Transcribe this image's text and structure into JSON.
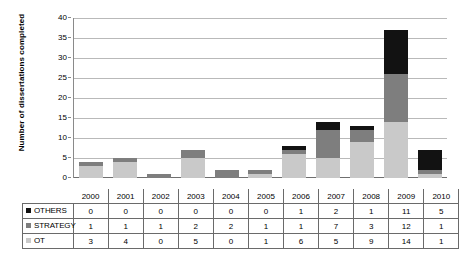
{
  "chart_data": {
    "type": "bar",
    "stacked": true,
    "title": "",
    "xlabel": "",
    "ylabel": "Number of dissertations completed",
    "ylim": [
      0,
      40
    ],
    "yticks": [
      0,
      5,
      10,
      15,
      20,
      25,
      30,
      35,
      40
    ],
    "grid": true,
    "legend_position": "table-row-labels",
    "categories": [
      "2000",
      "2001",
      "2002",
      "2003",
      "2004",
      "2005",
      "2006",
      "2007",
      "2008",
      "2009",
      "2010"
    ],
    "series": [
      {
        "name": "OT",
        "color": "#c9c9c9",
        "swatch": "ot-swatch",
        "values": [
          3,
          4,
          0,
          5,
          0,
          1,
          6,
          5,
          9,
          14,
          1
        ]
      },
      {
        "name": "STRATEGY",
        "color": "#7e7e7e",
        "swatch": "strategy-swatch",
        "values": [
          1,
          1,
          1,
          2,
          2,
          1,
          1,
          7,
          3,
          12,
          1
        ]
      },
      {
        "name": "OTHERS",
        "color": "#121212",
        "swatch": "others-swatch",
        "values": [
          0,
          0,
          0,
          0,
          0,
          0,
          1,
          2,
          1,
          11,
          5
        ]
      }
    ],
    "stack_order_bottom_to_top": [
      "OT",
      "STRATEGY",
      "OTHERS"
    ],
    "totals": [
      4,
      5,
      1,
      7,
      2,
      2,
      8,
      14,
      13,
      37,
      7
    ]
  },
  "axis": {
    "y_title": "Number of dissertations completed",
    "y_tick_labels": [
      "0",
      "5",
      "10",
      "15",
      "20",
      "25",
      "30",
      "35",
      "40"
    ]
  },
  "table": {
    "header": [
      "2000",
      "2001",
      "2002",
      "2003",
      "2004",
      "2005",
      "2006",
      "2007",
      "2008",
      "2009",
      "2010"
    ],
    "rows": [
      {
        "label": "OTHERS",
        "values": [
          "0",
          "0",
          "0",
          "0",
          "0",
          "0",
          "1",
          "2",
          "1",
          "11",
          "5"
        ]
      },
      {
        "label": "STRATEGY",
        "values": [
          "1",
          "1",
          "1",
          "2",
          "2",
          "1",
          "1",
          "7",
          "3",
          "12",
          "1"
        ]
      },
      {
        "label": "OT",
        "values": [
          "3",
          "4",
          "0",
          "5",
          "0",
          "1",
          "6",
          "5",
          "9",
          "14",
          "1"
        ]
      }
    ]
  },
  "colors": {
    "ot": "#c9c9c9",
    "strategy": "#7e7e7e",
    "others": "#121212",
    "gridline": "#b9b9b9",
    "axis": "#6f6f6f",
    "table_border": "#6a6a6a"
  }
}
